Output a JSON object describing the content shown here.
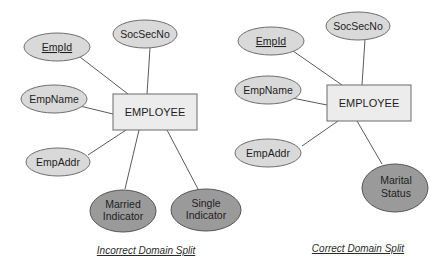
{
  "diagrams": [
    {
      "id": "incorrect",
      "caption": "Incorrect Domain Split",
      "entity": "EMPLOYEE",
      "attributes": [
        {
          "key": "empid",
          "lines": [
            "EmpId"
          ],
          "primary_key": true,
          "highlighted": false
        },
        {
          "key": "socsecno",
          "lines": [
            "SocSecNo"
          ],
          "primary_key": false,
          "highlighted": false
        },
        {
          "key": "empname",
          "lines": [
            "EmpName"
          ],
          "primary_key": false,
          "highlighted": false
        },
        {
          "key": "empaddr",
          "lines": [
            "EmpAddr"
          ],
          "primary_key": false,
          "highlighted": false
        },
        {
          "key": "married",
          "lines": [
            "Married",
            "Indicator"
          ],
          "primary_key": false,
          "highlighted": true
        },
        {
          "key": "single",
          "lines": [
            "Single",
            "Indicator"
          ],
          "primary_key": false,
          "highlighted": true
        }
      ]
    },
    {
      "id": "correct",
      "caption": "Correct Domain Split",
      "entity": "EMPLOYEE",
      "attributes": [
        {
          "key": "empid",
          "lines": [
            "EmpId"
          ],
          "primary_key": true,
          "highlighted": false
        },
        {
          "key": "socsecno",
          "lines": [
            "SocSecNo"
          ],
          "primary_key": false,
          "highlighted": false
        },
        {
          "key": "empname",
          "lines": [
            "EmpName"
          ],
          "primary_key": false,
          "highlighted": false
        },
        {
          "key": "empaddr",
          "lines": [
            "EmpAddr"
          ],
          "primary_key": false,
          "highlighted": false
        },
        {
          "key": "marital",
          "lines": [
            "Marital",
            "Status"
          ],
          "primary_key": false,
          "highlighted": true
        }
      ]
    }
  ],
  "colors": {
    "attribute_fill": "#d9d9d9",
    "highlighted_attribute_fill": "#9a9a9a",
    "entity_fill": "#ececec"
  }
}
